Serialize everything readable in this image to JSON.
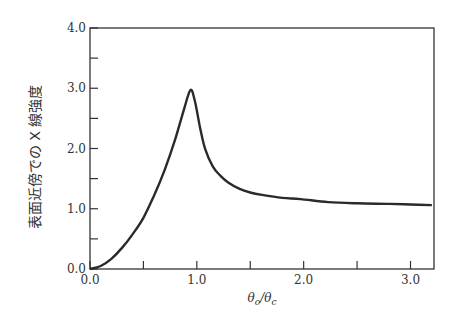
{
  "chart_data": {
    "type": "line",
    "title": "",
    "xlabel": "θo/θc",
    "ylabel": "表面近傍での X 線強度",
    "xlim": [
      0.0,
      3.22
    ],
    "ylim": [
      0.0,
      4.0
    ],
    "x_ticks": [
      0.0,
      0.5,
      1.0,
      1.5,
      2.0,
      2.5,
      3.0
    ],
    "x_tick_labels": [
      "0.0",
      "",
      "1.0",
      "",
      "2.0",
      "",
      "3.0"
    ],
    "y_ticks": [
      0.0,
      0.5,
      1.0,
      1.5,
      2.0,
      2.5,
      3.0,
      3.5,
      4.0
    ],
    "y_tick_labels": [
      "0.0",
      "",
      "1.0",
      "",
      "2.0",
      "",
      "3.0",
      "",
      "4.0"
    ],
    "grid": false,
    "legend": null,
    "series": [
      {
        "name": "X-ray intensity near surface",
        "color": "#2a2a2a",
        "x": [
          0.0,
          0.1,
          0.2,
          0.3,
          0.4,
          0.5,
          0.6,
          0.7,
          0.8,
          0.88,
          0.94,
          0.98,
          1.03,
          1.08,
          1.15,
          1.22,
          1.29,
          1.4,
          1.5,
          1.61,
          1.8,
          1.97,
          2.23,
          2.5,
          2.8,
          3.0,
          3.2
        ],
        "y": [
          0.0,
          0.05,
          0.17,
          0.35,
          0.58,
          0.85,
          1.22,
          1.65,
          2.17,
          2.65,
          2.97,
          2.8,
          2.35,
          1.98,
          1.7,
          1.55,
          1.44,
          1.33,
          1.27,
          1.23,
          1.18,
          1.16,
          1.11,
          1.09,
          1.08,
          1.07,
          1.06
        ]
      }
    ]
  },
  "axes": {
    "x_title_main": "θ",
    "x_title_sub1": "o",
    "x_title_slash": "/",
    "x_title_main2": "θ",
    "x_title_sub2": "c"
  }
}
